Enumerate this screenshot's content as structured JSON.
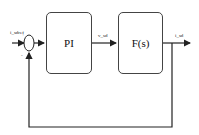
{
  "diagram": {
    "type": "closed-loop control block diagram",
    "input_label": "i_sdref",
    "summing_junction": {
      "plus_sign": "+",
      "minus_sign": "-"
    },
    "blocks": [
      {
        "id": "pi",
        "label": "PI"
      },
      {
        "id": "plant",
        "label": "F(s)"
      }
    ],
    "signals": {
      "controller_output": "v_sd",
      "plant_output": "i_sd"
    },
    "feedback": "unity negative feedback from i_sd to summing junction"
  }
}
